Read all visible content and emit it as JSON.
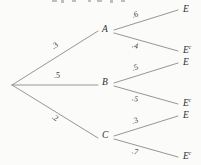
{
  "figure": {
    "type": "probability-tree-diagram",
    "background_color": "#fbfbfa",
    "line_color": "#8a8a90",
    "text_color": "#2e2e30"
  },
  "root": {
    "label": ""
  },
  "level1": [
    {
      "node": "A",
      "probability": ".3"
    },
    {
      "node": "B",
      "probability": ".5"
    },
    {
      "node": "C",
      "probability": ".2"
    }
  ],
  "level2": [
    {
      "parent": "A",
      "leaf": "E",
      "leaf_sup": "",
      "probability": ".6"
    },
    {
      "parent": "A",
      "leaf": "E",
      "leaf_sup": "c",
      "probability": ".4"
    },
    {
      "parent": "B",
      "leaf": "E",
      "leaf_sup": "",
      "probability": ".5"
    },
    {
      "parent": "B",
      "leaf": "E",
      "leaf_sup": "c",
      "probability": ".5"
    },
    {
      "parent": "C",
      "leaf": "E",
      "leaf_sup": "",
      "probability": ".3"
    },
    {
      "parent": "C",
      "leaf": "E",
      "leaf_sup": "c",
      "probability": ".7"
    }
  ]
}
